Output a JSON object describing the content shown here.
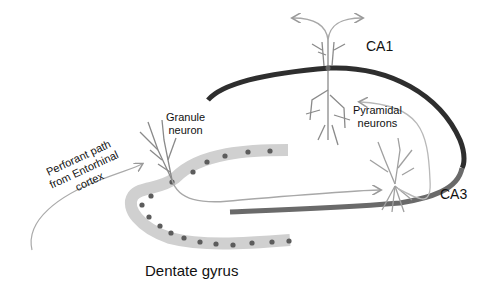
{
  "diagram": {
    "type": "hippocampus-trisynaptic-circuit",
    "labels": {
      "ca1": "CA1",
      "ca3": "CA3",
      "granule_line1": "Granule",
      "granule_line2": "neuron",
      "pyramidal_line1": "Pyramidal",
      "pyramidal_line2": "neurons",
      "perforant_line1": "Perforant path",
      "perforant_line2": "from Entorhinal",
      "perforant_line3": "cortex",
      "dentate": "Dentate gyrus"
    },
    "colors": {
      "ca1_band": "#2e2e2e",
      "ca3_band": "#6a6a6a",
      "dentate_band": "#d0d0d0",
      "dentate_dots": "#5c5c5c",
      "neuron": "#8a8a8a",
      "axon": "#a8a8a8"
    }
  }
}
